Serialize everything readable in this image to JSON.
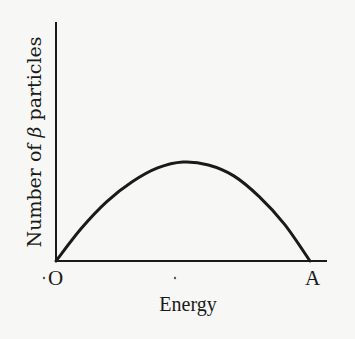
{
  "chart_data": {
    "type": "line",
    "title": "",
    "xlabel": "Energy",
    "ylabel_parts": [
      "Number of ",
      "β",
      " particles"
    ],
    "ylabel": "Number of β particles",
    "x_tick_labels": [
      "O",
      "A"
    ],
    "x": [
      0,
      0.1,
      0.2,
      0.3,
      0.4,
      0.5,
      0.6,
      0.7,
      0.8,
      0.9,
      1.0
    ],
    "series": [
      {
        "name": "beta spectrum",
        "values": [
          0,
          0.33,
          0.6,
          0.8,
          0.94,
          1.0,
          0.97,
          0.86,
          0.65,
          0.37,
          0
        ]
      }
    ],
    "peak": {
      "x": 0.5,
      "y": 1.0
    },
    "grid": false,
    "legend": null
  },
  "colors": {
    "curve": "#1a1a1a",
    "axes": "#1a1a1a",
    "background": "#f7f7f5"
  }
}
